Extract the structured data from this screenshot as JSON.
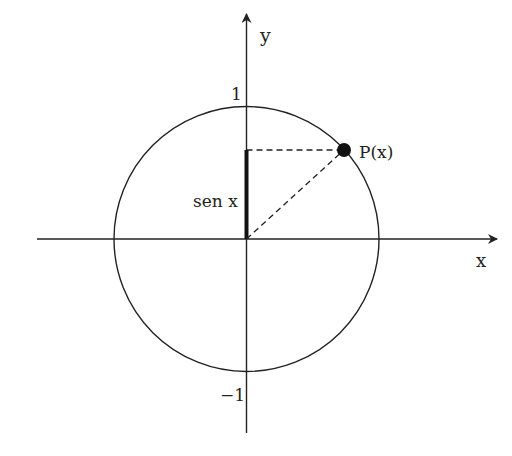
{
  "diagram": {
    "axes": {
      "x_label": "x",
      "y_label": "y",
      "y_tick_top": "1",
      "y_tick_bottom": "−1"
    },
    "point": {
      "label": "P(x)"
    },
    "segment": {
      "label": "sen x"
    },
    "colors": {
      "stroke": "#222222",
      "background": "#ffffff"
    }
  }
}
